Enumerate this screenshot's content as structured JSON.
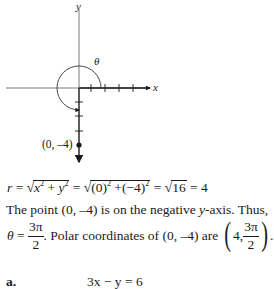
{
  "graph": {
    "x_label": "x",
    "y_label": "y",
    "theta_label": "θ",
    "point_label": "(0, –4)",
    "origin": [
      79,
      88
    ],
    "unit_px": 14.3,
    "point": [
      0,
      -4
    ],
    "ticks_x_positive": [
      1,
      2,
      3,
      4
    ],
    "ticks_y_negative": [
      -1,
      -2,
      -3
    ]
  },
  "line1": {
    "r": "r",
    "eq": " = ",
    "rad1_a": "x",
    "rad1_plus": " + ",
    "rad1_b": "y",
    "exp": "2",
    "eq2": " = ",
    "rad2_a": "(0)",
    "rad2_plus": " +",
    "rad2_b": "(−4)",
    "eq3": " = ",
    "rad3": "16",
    "result": " = 4"
  },
  "line2": {
    "pre": "The point (0, –4) is on the negative ",
    "y": "y",
    "post": "-axis. Thus,"
  },
  "line3": {
    "theta": "θ",
    "eq": " = ",
    "num": "3π",
    "den": "2",
    "mid": ". Polar coordinates of (0, –4) are ",
    "lparen": "(",
    "r_val": "4,",
    "num2": "3π",
    "den2": "2",
    "rparen": ")",
    "end": "."
  },
  "part_a": {
    "label": "a.",
    "equation": "3x − y = 6"
  }
}
